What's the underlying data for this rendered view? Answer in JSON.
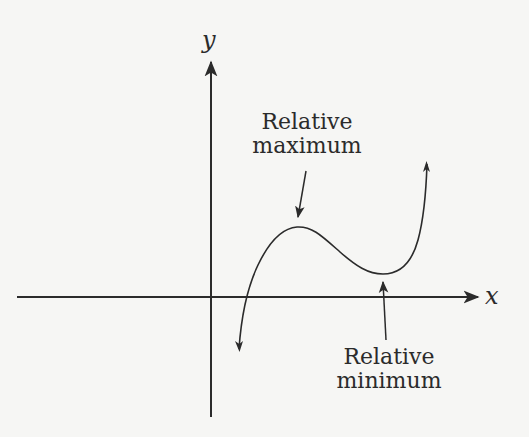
{
  "diagram": {
    "type": "function-graph",
    "axes": {
      "x_label": "x",
      "y_label": "y"
    },
    "annotations": {
      "relative_max": {
        "line1": "Relative",
        "line2": "maximum"
      },
      "relative_min": {
        "line1": "Relative",
        "line2": "minimum"
      }
    },
    "colors": {
      "background": "#f6f6f4",
      "ink": "#2b2b2b"
    }
  }
}
